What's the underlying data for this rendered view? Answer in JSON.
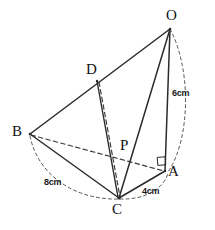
{
  "figure": {
    "kind": "geometry-diagram",
    "background_color": "#ffffff",
    "stroke_color": "#333333",
    "vertices": [
      {
        "id": "O",
        "label": "O",
        "x": 170,
        "y": 28
      },
      {
        "id": "D",
        "label": "D",
        "x": 97,
        "y": 80
      },
      {
        "id": "B",
        "label": "B",
        "x": 30,
        "y": 134
      },
      {
        "id": "P",
        "label": "P",
        "x": 118,
        "y": 152
      },
      {
        "id": "A",
        "label": "A",
        "x": 165,
        "y": 171
      },
      {
        "id": "C",
        "label": "C",
        "x": 119,
        "y": 198
      }
    ],
    "solid_edges": [
      {
        "name": "edge-B-O",
        "from": "B",
        "to": "O"
      },
      {
        "name": "edge-O-C",
        "from": "O",
        "to": "C"
      },
      {
        "name": "edge-O-A",
        "from": "O",
        "to": "A"
      },
      {
        "name": "edge-B-C",
        "from": "B",
        "to": "C"
      },
      {
        "name": "edge-C-A",
        "from": "C",
        "to": "A"
      },
      {
        "name": "edge-D-C",
        "from": "D",
        "to": "C"
      }
    ],
    "dashed_edges": [
      {
        "name": "edge-B-A",
        "from": "B",
        "to": "A"
      },
      {
        "name": "edge-D-P-C",
        "from": "D",
        "to": "C"
      }
    ],
    "arcs": [
      {
        "name": "arc-O-A",
        "from": "O",
        "to": "A",
        "measure": "6cm"
      },
      {
        "name": "arc-B-C",
        "from": "B",
        "to": "C",
        "measure": "8cm"
      },
      {
        "name": "arc-C-A",
        "from": "C",
        "to": "A",
        "measure": "4cm"
      }
    ],
    "measures": [
      {
        "id": "m-6cm",
        "label": "6cm",
        "x": 172,
        "y": 89,
        "edge": "OA"
      },
      {
        "id": "m-8cm",
        "label": "8cm",
        "x": 44,
        "y": 178,
        "edge": "BC"
      },
      {
        "id": "m-4cm",
        "label": "4cm",
        "x": 142,
        "y": 187,
        "edge": "CA"
      }
    ],
    "angle_markers": [
      {
        "id": "right-angle-A",
        "at": "A",
        "type": "right-angle",
        "x": 158,
        "y": 160
      }
    ]
  }
}
